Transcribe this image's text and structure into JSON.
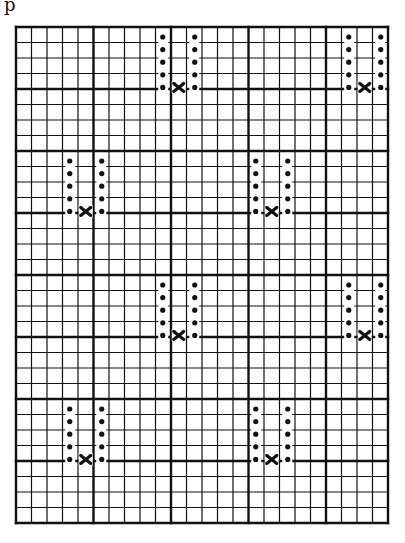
{
  "page": {
    "corner_label": "p"
  },
  "colors": {
    "ink": "#111111",
    "paper": "#ffffff"
  },
  "grid": {
    "columns": 24,
    "rows": 32,
    "major_column_every": 5,
    "major_row_every": 4
  },
  "motifs": [
    {
      "left_col": 9,
      "right_col": 11,
      "x_col": 10,
      "top_row": 0
    },
    {
      "left_col": 21,
      "right_col": 23,
      "x_col": 22,
      "top_row": 0
    },
    {
      "left_col": 3,
      "right_col": 5,
      "x_col": 4,
      "top_row": 8
    },
    {
      "left_col": 15,
      "right_col": 17,
      "x_col": 16,
      "top_row": 8
    },
    {
      "left_col": 9,
      "right_col": 11,
      "x_col": 10,
      "top_row": 16
    },
    {
      "left_col": 21,
      "right_col": 23,
      "x_col": 22,
      "top_row": 16
    },
    {
      "left_col": 3,
      "right_col": 5,
      "x_col": 4,
      "top_row": 24
    },
    {
      "left_col": 15,
      "right_col": 17,
      "x_col": 16,
      "top_row": 24
    }
  ],
  "motif_shape": {
    "dots_per_column": 5,
    "x_mark": "cross"
  }
}
